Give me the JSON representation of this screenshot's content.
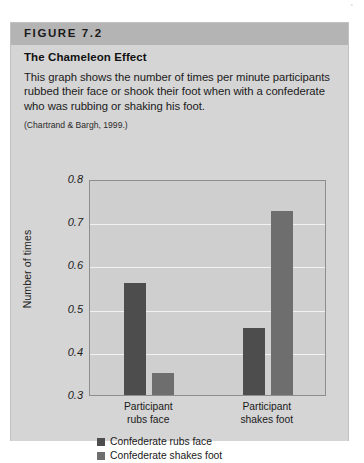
{
  "figure": {
    "label": "FIGURE 7.2",
    "title": "The Chameleon Effect",
    "description": "This graph shows the number of times per minute participants rubbed their face or shook their foot when with a confederate who was rubbing or shaking his foot.",
    "source": "(Chartrand & Bargh, 1999.)",
    "corner_mark": "°"
  },
  "colors": {
    "header_band": "#b4b4b4",
    "figure_background": "#d5d5d5",
    "plot_background": "#cfcfcf",
    "gridline": "#f2f2f2",
    "series_1": "#4d4d4d",
    "series_2": "#6e6e6e"
  },
  "chart_data": {
    "type": "bar",
    "title": "The Chameleon Effect",
    "xlabel": "",
    "ylabel": "Number of times",
    "ylim": [
      0.3,
      0.8
    ],
    "yticks": [
      "0.8",
      "0.7",
      "0.6",
      "0.5",
      "0.4",
      "0.3"
    ],
    "ytick_values": [
      0.8,
      0.7,
      0.6,
      0.5,
      0.4,
      0.3
    ],
    "grid": true,
    "legend_position": "bottom-left",
    "categories": [
      "Participant rubs face",
      "Participant shakes foot"
    ],
    "category_lines": [
      [
        "Participant",
        "rubs face"
      ],
      [
        "Participant",
        "shakes foot"
      ]
    ],
    "series": [
      {
        "name": "Confederate rubs face",
        "values": [
          0.56,
          0.455
        ],
        "color": "#4d4d4d"
      },
      {
        "name": "Confederate shakes foot",
        "values": [
          0.35,
          0.725
        ],
        "color": "#6e6e6e"
      }
    ]
  }
}
